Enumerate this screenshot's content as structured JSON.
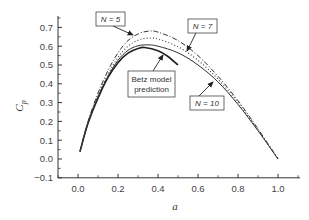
{
  "chart_data": {
    "type": "line",
    "title": "",
    "xlabel": "a",
    "ylabel": "C_p",
    "xlim": [
      -0.1,
      1.1
    ],
    "ylim": [
      -0.1,
      0.75
    ],
    "xticks": [
      "0.0",
      "0.2",
      "0.4",
      "0.6",
      "0.8",
      "1.0"
    ],
    "yticks": [
      "-0.1",
      "0.0",
      "0.1",
      "0.2",
      "0.3",
      "0.4",
      "0.5",
      "0.6",
      "0.7"
    ],
    "grid": false,
    "legend": "annotations with arrows",
    "series": [
      {
        "name": "Betz model prediction",
        "style": "solid-thick",
        "x": [
          0.01,
          0.05,
          0.1,
          0.15,
          0.2,
          0.25,
          0.3,
          0.333,
          0.4,
          0.45,
          0.5
        ],
        "y": [
          0.04,
          0.19,
          0.324,
          0.434,
          0.512,
          0.563,
          0.588,
          0.593,
          0.576,
          0.545,
          0.5
        ]
      },
      {
        "name": "N = 5",
        "style": "dash-dot",
        "x": [
          0.01,
          0.05,
          0.1,
          0.15,
          0.2,
          0.25,
          0.3,
          0.35,
          0.4,
          0.5,
          0.6,
          0.7,
          0.8,
          0.9,
          1.0
        ],
        "y": [
          0.04,
          0.2,
          0.35,
          0.47,
          0.565,
          0.63,
          0.665,
          0.68,
          0.675,
          0.63,
          0.55,
          0.44,
          0.31,
          0.16,
          0.0
        ]
      },
      {
        "name": "N = 7",
        "style": "dotted",
        "x": [
          0.01,
          0.05,
          0.1,
          0.15,
          0.2,
          0.25,
          0.3,
          0.35,
          0.4,
          0.5,
          0.6,
          0.7,
          0.8,
          0.9,
          1.0
        ],
        "y": [
          0.04,
          0.195,
          0.338,
          0.45,
          0.54,
          0.6,
          0.632,
          0.643,
          0.638,
          0.597,
          0.525,
          0.425,
          0.3,
          0.155,
          0.0
        ]
      },
      {
        "name": "N = 10",
        "style": "solid",
        "x": [
          0.01,
          0.05,
          0.1,
          0.15,
          0.2,
          0.25,
          0.3,
          0.35,
          0.4,
          0.5,
          0.6,
          0.7,
          0.8,
          0.9,
          1.0
        ],
        "y": [
          0.04,
          0.19,
          0.33,
          0.44,
          0.525,
          0.578,
          0.602,
          0.607,
          0.6,
          0.565,
          0.5,
          0.41,
          0.29,
          0.15,
          0.0
        ]
      }
    ],
    "annotations": [
      {
        "text": "N = 5",
        "target_series": "N = 5"
      },
      {
        "text": "N = 7",
        "target_series": "N = 7"
      },
      {
        "text": "Betz model",
        "text2": "prediction",
        "target_series": "Betz model prediction"
      },
      {
        "text": "N = 10",
        "target_series": "N = 10"
      }
    ]
  }
}
